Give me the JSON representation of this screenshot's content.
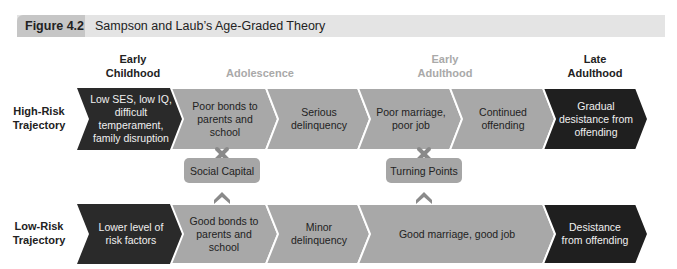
{
  "header": {
    "figure_label": "Figure 4.2",
    "title": "Sampson and Laub’s Age-Graded Theory"
  },
  "stages": [
    {
      "label": "Early\nChildhood",
      "emphasis": "bold-dark"
    },
    {
      "label": "Adolescence",
      "emphasis": "light"
    },
    {
      "label": "Early\nAdulthood",
      "emphasis": "light"
    },
    {
      "label": "Late\nAdulthood",
      "emphasis": "bold-dark"
    }
  ],
  "high_risk": {
    "label": "High-Risk\nTrajectory",
    "steps": [
      "Low SES, low IQ, difficult temperament, family disruption",
      "Poor bonds to parents and school",
      "Serious delinquency",
      "Poor marriage, poor job",
      "Continued offending",
      "Gradual desistance from offending"
    ]
  },
  "low_risk": {
    "label": "Low-Risk\nTrajectory",
    "steps": [
      "Lower level of risk factors",
      "Good bonds to parents and school",
      "Minor delinquency",
      "Good marriage, good job",
      "Desistance from offending"
    ]
  },
  "mediators": [
    {
      "label": "Social Capital",
      "top_icon": "x-icon",
      "bottom_icon": "chevron-up-icon"
    },
    {
      "label": "Turning Points",
      "top_icon": "x-icon",
      "bottom_icon": "chevron-up-icon"
    }
  ],
  "colors": {
    "dark_step": "#2a2a2a",
    "mid_step": "#a8a8a8",
    "header_bar": "#e4e4e4",
    "header_tag": "#c6c6c6",
    "icon": "#8a8a8a",
    "stage_light_text": "#a9a9a9"
  }
}
